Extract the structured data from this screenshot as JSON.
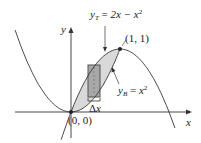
{
  "figure": {
    "type": "area-between-curves",
    "colors": {
      "curve": "#333333",
      "region_fill": "#d9d9d9",
      "rectangle_fill": "#a8a8a8",
      "rectangle_stroke": "#555555",
      "axis": "#333333"
    },
    "axes": {
      "x_label": "x",
      "y_label": "y"
    },
    "curves": [
      {
        "name": "top",
        "var": "y",
        "sub": "T",
        "rhs": "2x − x",
        "exp": "2",
        "label": "y_T = 2x − x^2"
      },
      {
        "name": "bottom",
        "var": "y",
        "sub": "B",
        "rhs": "x",
        "exp": "2",
        "label": "y_B = x^2"
      }
    ],
    "points": [
      {
        "label": "(0, 0)",
        "x": 0,
        "y": 0
      },
      {
        "label": "(1, 1)",
        "x": 1,
        "y": 1
      }
    ],
    "strip": {
      "label_delta": "Δ",
      "label_var": "x"
    }
  }
}
